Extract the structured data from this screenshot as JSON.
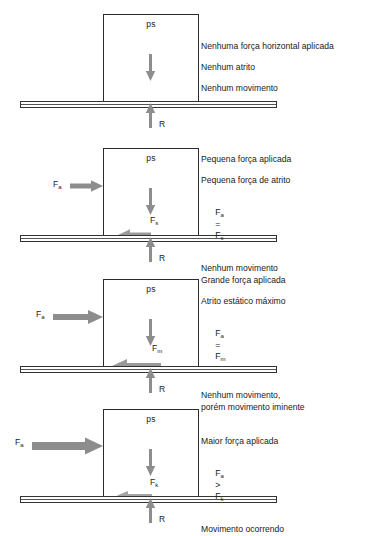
{
  "diagram": {
    "colors": {
      "outline": "#2b2b2b",
      "arrow_gray": "#8d8d8d",
      "arrow_gray_dark": "#7a7a7a",
      "text": "#1a1a1a",
      "background": "#ffffff"
    },
    "block_label": "ps",
    "normal_label": "R"
  },
  "panels": [
    {
      "id": "panel-no-force",
      "block_label": "ps",
      "normal_label": "R",
      "weight_arrow": true,
      "applied_force": null,
      "friction_force": null,
      "notes": [
        "Nenhuma força horizontal aplicada",
        "Nenhum atrito",
        "Nenhum movimento"
      ]
    },
    {
      "id": "panel-small-force",
      "block_label": "ps",
      "normal_label": "R",
      "weight_arrow": true,
      "applied_force": {
        "label": "F",
        "sub": "a",
        "length": 33,
        "thickness": 5
      },
      "friction_force": {
        "label": "F",
        "sub": "s",
        "length": 32,
        "thickness": 5
      },
      "notes": [
        "Pequena força aplicada",
        "Pequena força de atrito",
        "EQ:F|a| = |F|s",
        "Nenhum movimento"
      ],
      "equation": {
        "left_sym": "F",
        "left_sub": "a",
        "op": "=",
        "right_sym": "F",
        "right_sub": "s"
      }
    },
    {
      "id": "panel-max-static",
      "block_label": "ps",
      "normal_label": "R",
      "weight_arrow": true,
      "applied_force": {
        "label": "F",
        "sub": "a",
        "length": 50,
        "thickness": 6
      },
      "friction_force": {
        "label": "F",
        "sub": "m",
        "length": 48,
        "thickness": 6
      },
      "notes": [
        "Grande força aplicada",
        "Atrito estático máximo",
        "EQ:F|a| = |F|m",
        "Nenhum movimento,\nporém movimento iminente"
      ],
      "equation": {
        "left_sym": "F",
        "left_sub": "a",
        "op": "=",
        "right_sym": "F",
        "right_sub": "m"
      }
    },
    {
      "id": "panel-motion",
      "block_label": "ps",
      "normal_label": "R",
      "weight_arrow": true,
      "applied_force": {
        "label": "F",
        "sub": "a",
        "length": 71,
        "thickness": 8
      },
      "friction_force": {
        "label": "F",
        "sub": "k",
        "length": 34,
        "thickness": 3
      },
      "notes": [
        "Maior força aplicada",
        "EQ:F|a| > |F|k",
        "Movimento ocorrendo"
      ],
      "equation": {
        "left_sym": "F",
        "left_sub": "a",
        "op": ">",
        "right_sym": "F",
        "right_sub": "k"
      }
    }
  ]
}
